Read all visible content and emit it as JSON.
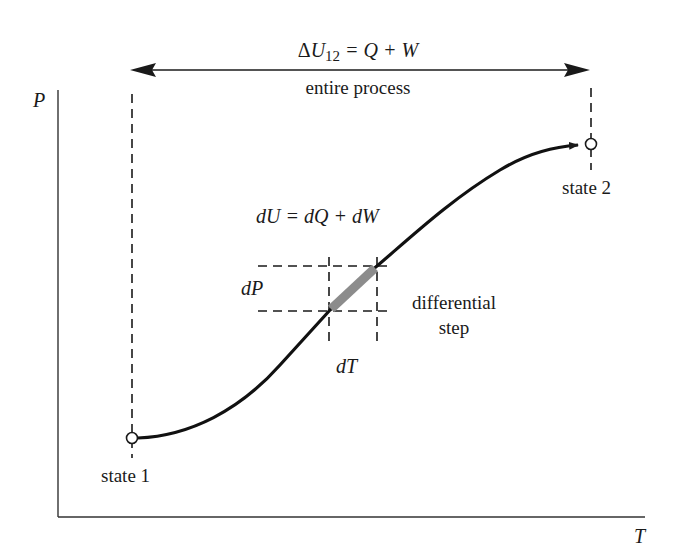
{
  "diagram": {
    "title_equation": {
      "delta": "Δ",
      "U": "U",
      "sub": "12",
      "rest": " = Q + W"
    },
    "process_label": "entire process",
    "differential_equation": "dU = dQ + dW",
    "differential_label_line1": "differential",
    "differential_label_line2": "step",
    "dP_label": "dP",
    "dT_label": "dT",
    "state1_label": "state 1",
    "state2_label": "state 2",
    "axis_y_label": "P",
    "axis_x_label": "T",
    "colors": {
      "ink": "#1a1a1a",
      "highlight_segment": "#8c8c8c",
      "background": "#ffffff"
    }
  }
}
